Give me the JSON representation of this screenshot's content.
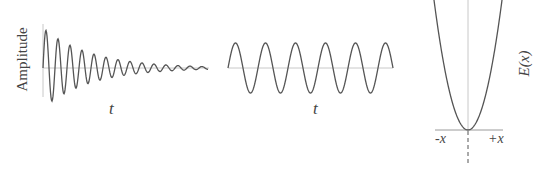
{
  "figure": {
    "colors": {
      "curve": "#555555",
      "axis": "#c8c8c8",
      "text": "#444444",
      "background": "#ffffff"
    },
    "panels": [
      {
        "id": "damped-oscillation",
        "ylabel": "Amplitude",
        "xlabel": "t",
        "curve": "damped sinusoid (amplitude decays with t)"
      },
      {
        "id": "undamped-oscillation",
        "xlabel": "t",
        "curve": "constant-amplitude sinusoid"
      },
      {
        "id": "potential-energy",
        "ylabel": "E(x)",
        "x_left_label": "-x",
        "x_right_label": "+x",
        "curve": "parabola E(x) ∝ x², minimum at x = 0"
      }
    ]
  },
  "chart_data": [
    {
      "type": "line",
      "title": "",
      "xlabel": "t",
      "ylabel": "Amplitude",
      "grid": false,
      "description": "Damped oscillation: sinusoid with exponentially decaying amplitude, ~14 cycles visible"
    },
    {
      "type": "line",
      "title": "",
      "xlabel": "t",
      "ylabel": "",
      "grid": false,
      "description": "Undamped oscillation: constant-amplitude sinusoid, ~5.5 cycles visible"
    },
    {
      "type": "line",
      "title": "",
      "xlabel": "",
      "x_tick_labels": [
        "-x",
        "+x"
      ],
      "ylabel": "E(x)",
      "grid": false,
      "description": "Parabolic potential energy curve with minimum at origin; dashed vertical line below origin"
    }
  ]
}
